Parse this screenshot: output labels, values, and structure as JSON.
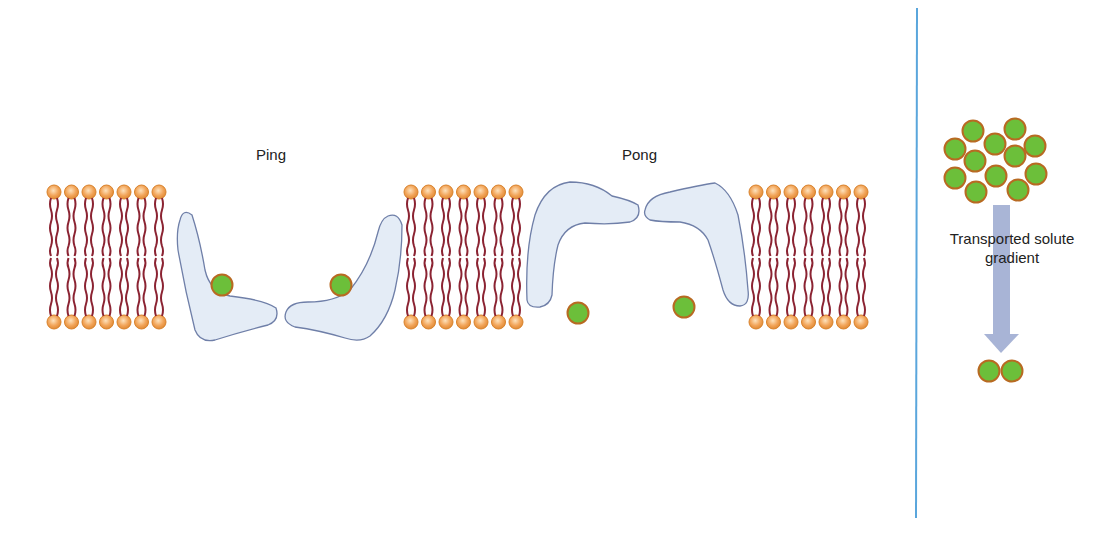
{
  "diagram": {
    "type": "ping-pong transporter mechanism",
    "labels": {
      "ping": "Ping",
      "pong": "Pong",
      "gradient_line1": "Transported solute",
      "gradient_line2": "gradient"
    },
    "colors": {
      "lipid_head": "#f2a55a",
      "lipid_head_edge": "#d9822b",
      "lipid_tail": "#8b2332",
      "protein_fill": "#e4ecf6",
      "protein_edge": "#6f7fa8",
      "solute_fill": "#6cbf3a",
      "solute_edge": "#b86a22",
      "divider": "#5aa6dc",
      "arrow": "#9aa8cf"
    },
    "membrane_segments": [
      {
        "name": "membrane-left",
        "x_start": 54
      },
      {
        "name": "membrane-middle",
        "x_start": 411
      },
      {
        "name": "membrane-right",
        "x_start": 756
      }
    ],
    "solute_cluster_high": [
      [
        973,
        131
      ],
      [
        1015,
        129
      ],
      [
        955,
        149
      ],
      [
        995,
        144
      ],
      [
        1035,
        146
      ],
      [
        975,
        161
      ],
      [
        1015,
        156
      ],
      [
        955,
        178
      ],
      [
        996,
        176
      ],
      [
        1036,
        174
      ],
      [
        976,
        192
      ],
      [
        1018,
        190
      ]
    ],
    "solute_cluster_low": [
      [
        989,
        371
      ],
      [
        1012,
        371
      ]
    ]
  }
}
